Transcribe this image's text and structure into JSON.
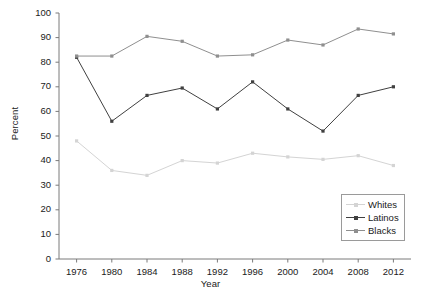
{
  "chart_data": {
    "type": "line",
    "title": "",
    "xlabel": "Year",
    "ylabel": "Percent",
    "categories": [
      "1976",
      "1980",
      "1984",
      "1988",
      "1992",
      "1996",
      "2000",
      "2004",
      "2008",
      "2012"
    ],
    "x": [
      1976,
      1980,
      1984,
      1988,
      1992,
      1996,
      2000,
      2004,
      2008,
      2012
    ],
    "xlim": [
      1974,
      2014
    ],
    "ylim": [
      0,
      100
    ],
    "ytick_labels": [
      "0",
      "10",
      "20",
      "30",
      "40",
      "50",
      "60",
      "70",
      "80",
      "90",
      "100"
    ],
    "yticks": [
      0,
      10,
      20,
      30,
      40,
      50,
      60,
      70,
      80,
      90,
      100
    ],
    "grid": false,
    "legend_position": "bottom-right",
    "series": [
      {
        "name": "Whites",
        "color": "#d4d4d4",
        "marker": "square",
        "values": [
          48,
          36,
          34,
          40,
          39,
          43,
          41.5,
          40.5,
          42,
          38
        ]
      },
      {
        "name": "Latinos",
        "color": "#404040",
        "marker": "square",
        "values": [
          82,
          56,
          66.5,
          69.5,
          61,
          72,
          61,
          52,
          66.5,
          70
        ]
      },
      {
        "name": "Blacks",
        "color": "#8f8f8f",
        "marker": "square",
        "values": [
          82.5,
          82.5,
          90.5,
          88.5,
          82.5,
          83,
          89,
          87,
          93.5,
          91.5
        ]
      }
    ]
  },
  "legend": {
    "entries": [
      {
        "label": "Whites"
      },
      {
        "label": "Latinos"
      },
      {
        "label": "Blacks"
      }
    ]
  },
  "axes": {
    "x_title": "Year",
    "y_title": "Percent",
    "axis_color": "#7a7a7a"
  }
}
